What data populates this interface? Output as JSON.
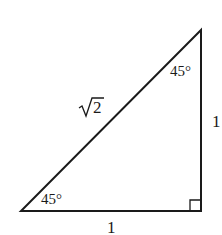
{
  "diagram": {
    "type": "right-triangle",
    "vertices": {
      "top": [
        201,
        30
      ],
      "bottom_left": [
        21,
        211
      ],
      "bottom_right": [
        201,
        211
      ]
    },
    "labels": {
      "hypotenuse": "√2",
      "hypotenuse_radicand": "2",
      "vertical_side": "1",
      "horizontal_side": "1",
      "top_angle": "45°",
      "bottom_left_angle": "45°"
    },
    "right_angle_marker": "bottom_right",
    "stroke_color": "#1a1a1a",
    "background": "#ffffff"
  }
}
